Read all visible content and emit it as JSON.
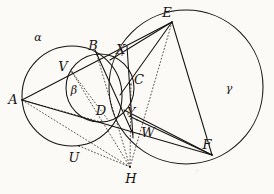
{
  "figure": {
    "background_color": "#fbfaf7",
    "ink_color": "#15120f",
    "width": 274,
    "height": 194
  },
  "circles": [
    {
      "name": "alpha",
      "label": "α",
      "cx": 72,
      "cy": 96,
      "r": 50,
      "label_x": 38,
      "label_y": 37,
      "style": "solid"
    },
    {
      "name": "beta",
      "label": "β",
      "cx": 100,
      "cy": 88,
      "r": 34,
      "label_x": 74,
      "label_y": 90,
      "style": "solid"
    },
    {
      "name": "gamma",
      "label": "γ",
      "cx": 186,
      "cy": 87,
      "r": 77,
      "label_x": 229,
      "label_y": 88,
      "style": "solid"
    }
  ],
  "points": [
    {
      "name": "A",
      "label": "A",
      "x": 22,
      "y": 100,
      "label_x": 13,
      "label_y": 99
    },
    {
      "name": "B",
      "label": "B",
      "x": 98,
      "y": 54,
      "label_x": 93,
      "label_y": 45
    },
    {
      "name": "C",
      "label": "C",
      "x": 131,
      "y": 84,
      "label_x": 139,
      "label_y": 79
    },
    {
      "name": "D",
      "label": "D",
      "x": 101,
      "y": 122,
      "label_x": 101,
      "label_y": 110
    },
    {
      "name": "E",
      "label": "E",
      "x": 172,
      "y": 22,
      "label_x": 167,
      "label_y": 12
    },
    {
      "name": "F",
      "label": "F",
      "x": 212,
      "y": 155,
      "label_x": 207,
      "label_y": 144
    },
    {
      "name": "U",
      "label": "U",
      "x": 79,
      "y": 146,
      "label_x": 74,
      "label_y": 157
    },
    {
      "name": "V",
      "label": "V",
      "x": 72,
      "y": 72,
      "label_x": 63,
      "label_y": 66
    },
    {
      "name": "W",
      "label": "W",
      "x": 137,
      "y": 120,
      "label_x": 148,
      "label_y": 132
    },
    {
      "name": "X",
      "label": "X",
      "x": 122,
      "y": 55,
      "label_x": 121,
      "label_y": 49
    },
    {
      "name": "Y",
      "label": "Y",
      "x": 128,
      "y": 114,
      "label_x": 131,
      "label_y": 112
    },
    {
      "name": "H",
      "label": "H",
      "x": 130,
      "y": 167,
      "label_x": 131,
      "label_y": 178
    }
  ],
  "solid_lines": [
    {
      "name": "A-to-E-tangent",
      "x1": 22,
      "y1": 100,
      "x2": 172,
      "y2": 22
    },
    {
      "name": "A-to-F-tangent",
      "x1": 22,
      "y1": 100,
      "x2": 212,
      "y2": 155
    },
    {
      "name": "E-to-F-chord",
      "x1": 172,
      "y1": 22,
      "x2": 212,
      "y2": 155
    },
    {
      "name": "E-to-C-line",
      "x1": 172,
      "y1": 22,
      "x2": 120,
      "y2": 95
    },
    {
      "name": "E-to-X-line",
      "x1": 172,
      "y1": 22,
      "x2": 110,
      "y2": 60
    },
    {
      "name": "F-to-W-line",
      "x1": 212,
      "y1": 155,
      "x2": 131,
      "y2": 117
    },
    {
      "name": "F-to-Y-line",
      "x1": 212,
      "y1": 155,
      "x2": 124,
      "y2": 110
    },
    {
      "name": "B-to-Y-line",
      "x1": 95,
      "y1": 50,
      "x2": 133,
      "y2": 134
    },
    {
      "name": "C-vertical-line",
      "x1": 127,
      "y1": 46,
      "x2": 133,
      "y2": 138
    }
  ],
  "dotted_lines": [
    {
      "name": "H-to-B-ray",
      "x1": 130,
      "y1": 167,
      "x2": 96,
      "y2": 52
    },
    {
      "name": "H-to-V-ray",
      "x1": 130,
      "y1": 167,
      "x2": 72,
      "y2": 72
    },
    {
      "name": "H-to-C-ray",
      "x1": 130,
      "y1": 167,
      "x2": 131,
      "y2": 84
    },
    {
      "name": "H-to-E-ray",
      "x1": 130,
      "y1": 167,
      "x2": 172,
      "y2": 22
    },
    {
      "name": "H-to-A-ray",
      "x1": 130,
      "y1": 167,
      "x2": 22,
      "y2": 100
    },
    {
      "name": "H-to-U-ray",
      "x1": 130,
      "y1": 167,
      "x2": 79,
      "y2": 146
    },
    {
      "name": "A-to-D-ray",
      "x1": 22,
      "y1": 100,
      "x2": 101,
      "y2": 122
    },
    {
      "name": "V-to-D-chord",
      "x1": 72,
      "y1": 72,
      "x2": 108,
      "y2": 120
    }
  ],
  "caption": {
    "alpha_name": "α",
    "beta_name": "β",
    "gamma_name": "γ"
  }
}
